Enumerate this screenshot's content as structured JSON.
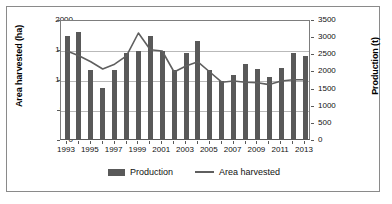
{
  "chart_data": {
    "type": "bar",
    "title": "",
    "subtitle": "",
    "xlabel": "",
    "ylabel": "Area harvested (ha)",
    "ylabel_secondary": "Production (t)",
    "categories": [
      "1993",
      "1994",
      "1995",
      "1996",
      "1997",
      "1998",
      "1999",
      "2000",
      "2001",
      "2002",
      "2003",
      "2004",
      "2005",
      "2006",
      "2007",
      "2008",
      "2009",
      "2010",
      "2011",
      "2012",
      "2013"
    ],
    "xtick_labels": [
      "1993",
      "1995",
      "1997",
      "1999",
      "2001",
      "2003",
      "2005",
      "2007",
      "2009",
      "2011",
      "2013"
    ],
    "ylim": [
      0,
      2000
    ],
    "ylim_secondary": [
      0,
      3500
    ],
    "yticks": [
      0,
      500,
      1000,
      1500,
      2000
    ],
    "yticks_secondary": [
      0,
      500,
      1000,
      1500,
      2000,
      2500,
      3000,
      3500
    ],
    "grid": true,
    "legend_position": "bottom",
    "series": [
      {
        "name": "Production",
        "kind": "bar",
        "axis": "secondary",
        "unit": "t",
        "color": "#595959",
        "values": [
          3000,
          3120,
          2000,
          1500,
          2000,
          2500,
          2580,
          3000,
          2580,
          2000,
          2500,
          2870,
          2000,
          1700,
          1870,
          2200,
          2050,
          1800,
          2080,
          2500,
          2420
        ]
      },
      {
        "name": "Area harvested",
        "kind": "line",
        "axis": "primary",
        "unit": "ha",
        "color": "#5f5f5f",
        "values": [
          1500,
          1420,
          1320,
          1200,
          1280,
          1420,
          1800,
          1520,
          1500,
          1150,
          1250,
          1320,
          1150,
          980,
          1000,
          980,
          970,
          940,
          1000,
          1020,
          1020
        ]
      }
    ],
    "legend": [
      "Production",
      "Area harvested"
    ]
  }
}
